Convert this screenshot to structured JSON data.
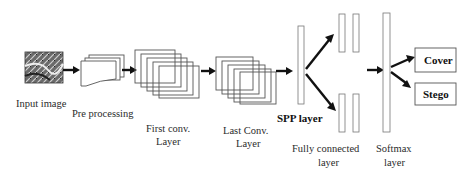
{
  "diagram": {
    "stages": {
      "input": "Input image",
      "pre": "Pre processing",
      "first_conv_1": "First conv.",
      "first_conv_2": "Layer",
      "last_conv_1": "Last Conv.",
      "last_conv_2": "Layer",
      "spp": "SPP layer",
      "fc_1": "Fully connected",
      "fc_2": "layer",
      "softmax_1": "Softmax",
      "softmax_2": "layer"
    },
    "outputs": {
      "cover": "Cover",
      "stego": "Stego"
    }
  }
}
